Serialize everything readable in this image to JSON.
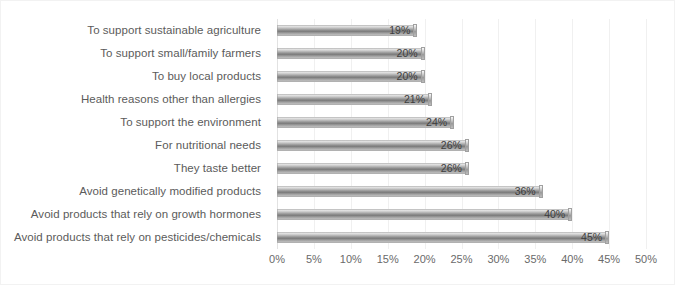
{
  "chart_data": {
    "type": "bar",
    "orientation": "horizontal",
    "title": "",
    "subtitle": "",
    "xlabel": "",
    "ylabel": "",
    "xlim": [
      0,
      50
    ],
    "tick_step": 5,
    "grid": true,
    "legend": false,
    "value_suffix": "%",
    "tick_labels": [
      "0%",
      "5%",
      "10%",
      "15%",
      "20%",
      "25%",
      "30%",
      "35%",
      "40%",
      "45%",
      "50%"
    ],
    "tick_values": [
      0,
      5,
      10,
      15,
      20,
      25,
      30,
      35,
      40,
      45,
      50
    ],
    "categories": [
      "To support sustainable agriculture",
      "To support small/family farmers",
      "To buy local products",
      "Health reasons other than allergies",
      "To support the environment",
      "For nutritional needs",
      "They taste better",
      "Avoid genetically modified products",
      "Avoid products that rely on growth hormones",
      "Avoid products that rely on pesticides/chemicals"
    ],
    "values": [
      19,
      20,
      20,
      21,
      24,
      26,
      26,
      36,
      40,
      45
    ],
    "data_labels": [
      "19%",
      "20%",
      "20%",
      "21%",
      "24%",
      "26%",
      "26%",
      "36%",
      "40%",
      "45%"
    ],
    "colors": {
      "bar_light": "#f4f4f4",
      "bar_mid": "#7c7c7c",
      "bar_edge": "#9b9b9b",
      "grid": "#f0f0f0",
      "label_text": "#5b5b5b",
      "value_text": "#3d3d3d",
      "background": "#ffffff"
    }
  }
}
